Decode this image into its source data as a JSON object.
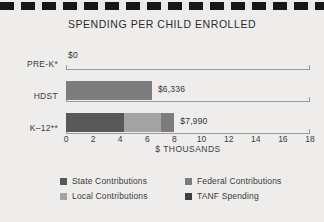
{
  "decor": {
    "band_name": "dashed-rule"
  },
  "chart_data": {
    "type": "bar",
    "orientation": "horizontal",
    "stacked": true,
    "title": "SPENDING PER CHILD ENROLLED",
    "xlabel": "$ THOUSANDS",
    "ylabel": "",
    "xlim": [
      0,
      18
    ],
    "xticks": [
      0,
      2,
      4,
      6,
      8,
      10,
      12,
      14,
      16,
      18
    ],
    "xtick_labels": [
      "0",
      "2",
      "4",
      "6",
      "8",
      "10",
      "12",
      "14",
      "16",
      "18"
    ],
    "grid": false,
    "legend_position": "bottom",
    "categories": [
      "PRE-K*",
      "HDST",
      "K–12**"
    ],
    "series": [
      {
        "name": "State Contributions",
        "color": "#58585a",
        "values": [
          0,
          0,
          4.3
        ]
      },
      {
        "name": "Local Contributions",
        "color": "#a3a3a5",
        "values": [
          0,
          0,
          2.7
        ]
      },
      {
        "name": "Federal Contributions",
        "color": "#7c7c7e",
        "values": [
          0,
          6.336,
          1.0
        ]
      },
      {
        "name": "TANF Spending",
        "color": "#3f3f41",
        "values": [
          0,
          0,
          0.0
        ]
      }
    ],
    "totals": [
      0,
      6.336,
      7.99
    ],
    "data_labels": [
      "$0",
      "$6,336",
      "$7,990"
    ],
    "annotations": []
  },
  "legend": {
    "items": [
      {
        "label": "State Contributions",
        "color": "#58585a"
      },
      {
        "label": "Federal Contributions",
        "color": "#7c7c7e"
      },
      {
        "label": "Local Contributions",
        "color": "#a3a3a5"
      },
      {
        "label": "TANF Spending",
        "color": "#3f3f41"
      }
    ]
  }
}
